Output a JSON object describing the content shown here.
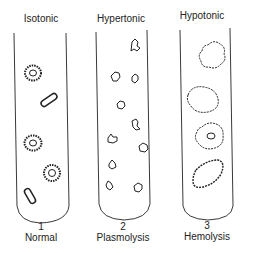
{
  "tubes": [
    {
      "title": "Isotonic",
      "number": "1",
      "caption": "Normal"
    },
    {
      "title": "Hypertonic",
      "number": "2",
      "caption": "Plasmolysis"
    },
    {
      "title": "Hypotonic",
      "number": "3",
      "caption": "Hemolysis"
    }
  ],
  "colors": {
    "ink": "#222222",
    "background": "#ffffff"
  }
}
